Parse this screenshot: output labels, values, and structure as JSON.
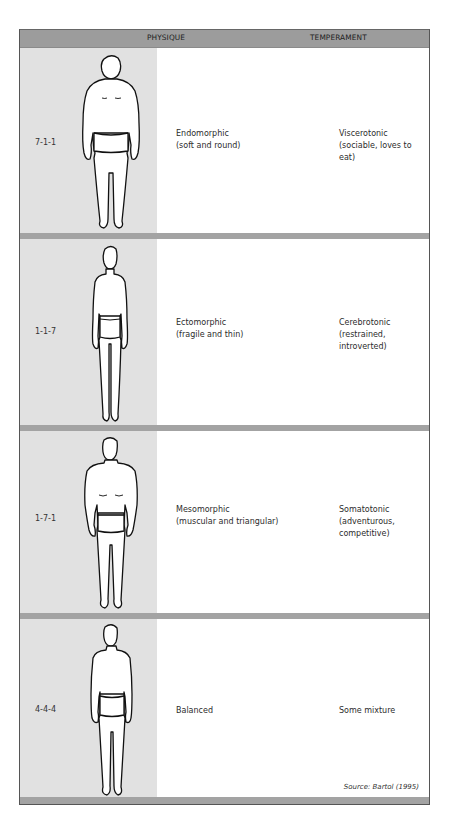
{
  "header": {
    "physique_label": "PHYSIQUE",
    "temperament_label": "TEMPERAMENT"
  },
  "rows": [
    {
      "code": "7-1-1",
      "physique": "Endomorphic",
      "physique_desc": "(soft and round)",
      "temperament": "Viscerotonic",
      "temperament_desc": "(sociable, loves to eat)",
      "figure": "endomorph-figure"
    },
    {
      "code": "1-1-7",
      "physique": "Ectomorphic",
      "physique_desc": "(fragile and thin)",
      "temperament": "Cerebrotonic",
      "temperament_desc": "(restrained, introverted)",
      "figure": "ectomorph-figure"
    },
    {
      "code": "1-7-1",
      "physique": "Mesomorphic",
      "physique_desc": "(muscular and triangular)",
      "temperament": "Somatotonic",
      "temperament_desc": "(adventurous, competitive)",
      "figure": "mesomorph-figure"
    },
    {
      "code": "4-4-4",
      "physique": "Balanced",
      "physique_desc": "",
      "temperament": "Some mixture",
      "temperament_desc": "",
      "figure": "balanced-figure"
    }
  ],
  "source": {
    "prefix": "Source:",
    "citation": "Bartol (1995)"
  },
  "colors": {
    "header_bg": "#9c9c9c",
    "left_column_bg": "#e1e1e1",
    "separator": "#a3a3a3",
    "border": "#555555"
  }
}
